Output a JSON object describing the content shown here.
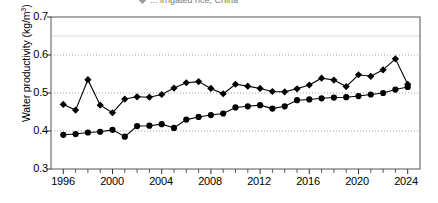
{
  "figure": {
    "legend_partial_text": "... irrigated rice, China",
    "legend_marker_icon": "diamond-marker-icon"
  },
  "axes": {
    "y_axis_title": "Water productivity (kg/m",
    "y_axis_title_sup": "3",
    "y_axis_title_tail": ")",
    "y_ticks": [
      "0.3",
      "0.4",
      "0.5",
      "0.6",
      "0.7"
    ],
    "x_ticks": [
      "1996",
      "2000",
      "2004",
      "2008",
      "2012",
      "2016",
      "2020",
      "2024"
    ]
  },
  "chart_data": {
    "type": "line",
    "title": "",
    "subtitle": "",
    "xlabel": "",
    "ylabel": "Water productivity (kg/m3)",
    "xlim": [
      1995,
      2025
    ],
    "ylim": [
      0.3,
      0.7
    ],
    "ytick_values": [
      0.3,
      0.4,
      0.5,
      0.6,
      0.7
    ],
    "xtick_values": [
      1996,
      2000,
      2004,
      2008,
      2012,
      2016,
      2020,
      2024
    ],
    "xtick_minor_step": 1,
    "grid": "horizontal-dotted",
    "legend_position": "top",
    "x": [
      1996,
      1997,
      1998,
      1999,
      2000,
      2001,
      2002,
      2003,
      2004,
      2005,
      2006,
      2007,
      2008,
      2009,
      2010,
      2011,
      2012,
      2013,
      2014,
      2015,
      2016,
      2017,
      2018,
      2019,
      2020,
      2021,
      2022,
      2023,
      2024
    ],
    "series": [
      {
        "name": "series-diamond",
        "marker": "diamond",
        "color": "#000000",
        "values": [
          0.47,
          0.455,
          0.535,
          0.468,
          0.448,
          0.484,
          0.49,
          0.489,
          0.496,
          0.513,
          0.527,
          0.53,
          0.512,
          0.498,
          0.523,
          0.518,
          0.512,
          0.504,
          0.503,
          0.511,
          0.521,
          0.539,
          0.534,
          0.517,
          0.548,
          0.544,
          0.561,
          0.59,
          0.523
        ]
      },
      {
        "name": "series-circle",
        "marker": "circle",
        "color": "#000000",
        "values": [
          0.39,
          0.392,
          0.396,
          0.398,
          0.403,
          0.385,
          0.413,
          0.414,
          0.418,
          0.408,
          0.43,
          0.437,
          0.442,
          0.446,
          0.462,
          0.465,
          0.468,
          0.459,
          0.465,
          0.481,
          0.483,
          0.486,
          0.488,
          0.489,
          0.492,
          0.496,
          0.5,
          0.509,
          0.516
        ]
      }
    ]
  }
}
